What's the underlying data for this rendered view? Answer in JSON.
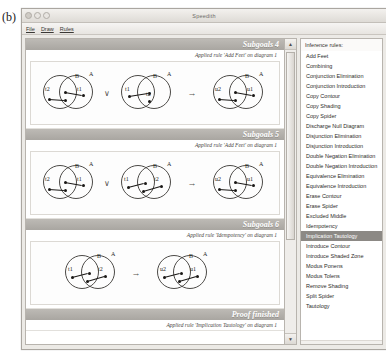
{
  "figure_label": "(b)",
  "window": {
    "title": "Speedith",
    "controls": [
      "close",
      "minimize",
      "zoom"
    ],
    "menu": [
      "File",
      "Draw",
      "Rules"
    ]
  },
  "proof": {
    "sections": [
      {
        "header": "Subgoals 4",
        "rule_text": "Applied rule 'Add Feet' on diagram 1",
        "diagrams": [
          {
            "contours": [
              "B",
              "A"
            ],
            "spiders": [
              "t2",
              "t1"
            ]
          },
          {
            "contours": [
              "B",
              "A"
            ],
            "spiders": [
              "t1",
              "t2"
            ]
          },
          {
            "contours": [
              "B",
              "A"
            ],
            "spiders": [
              "u2",
              "u1"
            ]
          }
        ],
        "operators": [
          "∨",
          "→"
        ]
      },
      {
        "header": "Subgoals 5",
        "rule_text": "Applied rule 'Add Feet' on diagram 1",
        "diagrams": [
          {
            "contours": [
              "B",
              "A"
            ],
            "spiders": [
              "t2",
              "t1"
            ]
          },
          {
            "contours": [
              "B",
              "A"
            ],
            "spiders": [
              "t1",
              "t2"
            ]
          },
          {
            "contours": [
              "B",
              "A"
            ],
            "spiders": [
              "u2",
              "u1"
            ]
          }
        ],
        "operators": [
          "∨",
          "→"
        ]
      },
      {
        "header": "Subgoals 6",
        "rule_text": "Applied rule 'Idempotency' on diagram 1",
        "diagrams": [
          {
            "contours": [
              "B",
              "A"
            ],
            "spiders": [
              "t1",
              "t2"
            ]
          },
          {
            "contours": [
              "B",
              "A"
            ],
            "spiders": [
              "u2",
              "u1"
            ]
          }
        ],
        "operators": [
          "→"
        ]
      }
    ],
    "footer": {
      "header": "Proof finished",
      "rule_text": "Applied rule 'Implication Tautology' on diagram 1"
    }
  },
  "scrollbar": {
    "up_arrow": "▲",
    "down_arrow": "▼"
  },
  "rules_panel": {
    "title": "Inference rules:",
    "selected": "Implication Tautology",
    "items": [
      "Add Feet",
      "Combining",
      "Conjunction Elimination",
      "Conjunction Introduction",
      "Copy Contour",
      "Copy Shading",
      "Copy Spider",
      "Discharge Null Diagram",
      "Disjunction Elimination",
      "Disjunction Introduction",
      "Double Negation Elimination",
      "Double Negation Introduction",
      "Equivalence Elimination",
      "Equivalence Introduction",
      "Erase Contour",
      "Erase Spider",
      "Excluded Middle",
      "Idempotency",
      "Implication Tautology",
      "Introduce Contour",
      "Introduce Shaded Zone",
      "Modus Ponens",
      "Modus Tolens",
      "Remove Shading",
      "Split Spider",
      "Tautology"
    ]
  },
  "colors": {
    "header_band": "#b0ada8",
    "selection": "#8c8985",
    "window_chrome": "#eceae6"
  }
}
